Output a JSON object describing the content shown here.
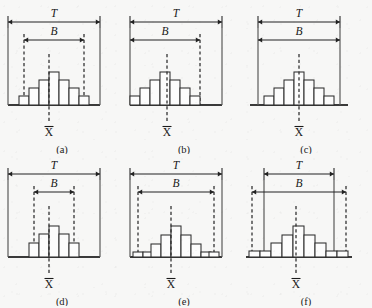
{
  "figure": {
    "background_color": "#f7f7f6",
    "ink_color": "#222222",
    "bar_fill_color": "#fcfcfc",
    "labels": {
      "tolerance": "T",
      "spread": "B",
      "mean": "X"
    },
    "panels": [
      {
        "id": "a",
        "caption": "(a)",
        "tolerance_label": "T",
        "spread_label": "B",
        "mean_label": "X",
        "frame": "box",
        "t_left": 8,
        "t_right": 100,
        "b_left": 24,
        "b_right": 84,
        "b_markers": "dashed-both",
        "mean_x": 54,
        "bars": [
          {
            "x": 24,
            "w": 10,
            "h": 9
          },
          {
            "x": 34,
            "w": 10,
            "h": 17
          },
          {
            "x": 44,
            "w": 10,
            "h": 25
          },
          {
            "x": 54,
            "w": 10,
            "h": 33
          },
          {
            "x": 64,
            "w": 10,
            "h": 25
          },
          {
            "x": 74,
            "w": 10,
            "h": 17
          },
          {
            "x": 84,
            "w": 10,
            "h": 9
          }
        ],
        "bars_offset": -5
      },
      {
        "id": "b",
        "caption": "(b)",
        "tolerance_label": "T",
        "spread_label": "B",
        "mean_label": "X",
        "frame": "box",
        "t_left": 8,
        "t_right": 100,
        "b_left": 8,
        "b_right": 78,
        "b_markers": "dashed-right",
        "mean_x": 45,
        "bars": [
          {
            "x": 8,
            "w": 10,
            "h": 9
          },
          {
            "x": 18,
            "w": 10,
            "h": 17
          },
          {
            "x": 28,
            "w": 10,
            "h": 25
          },
          {
            "x": 38,
            "w": 10,
            "h": 33
          },
          {
            "x": 48,
            "w": 10,
            "h": 25
          },
          {
            "x": 58,
            "w": 10,
            "h": 17
          },
          {
            "x": 68,
            "w": 10,
            "h": 9
          }
        ],
        "bars_offset": 0
      },
      {
        "id": "c",
        "caption": "(c)",
        "tolerance_label": "T",
        "spread_label": "B",
        "mean_label": "X",
        "frame": "baseline",
        "t_left": 14,
        "t_right": 96,
        "b_left": 14,
        "b_right": 96,
        "b_markers": "none",
        "mean_x": 55,
        "bars": [
          {
            "x": 20,
            "w": 10,
            "h": 9
          },
          {
            "x": 30,
            "w": 10,
            "h": 17
          },
          {
            "x": 40,
            "w": 10,
            "h": 25
          },
          {
            "x": 50,
            "w": 10,
            "h": 33
          },
          {
            "x": 60,
            "w": 10,
            "h": 25
          },
          {
            "x": 70,
            "w": 10,
            "h": 17
          },
          {
            "x": 80,
            "w": 10,
            "h": 9
          }
        ],
        "bars_offset": 0
      },
      {
        "id": "d",
        "caption": "(d)",
        "tolerance_label": "T",
        "spread_label": "B",
        "mean_label": "X",
        "frame": "box",
        "t_left": 8,
        "t_right": 100,
        "b_left": 34,
        "b_right": 74,
        "b_markers": "dashed-both",
        "mean_x": 54,
        "bars": [
          {
            "x": 34,
            "w": 10,
            "h": 14
          },
          {
            "x": 44,
            "w": 10,
            "h": 23
          },
          {
            "x": 54,
            "w": 10,
            "h": 31
          },
          {
            "x": 64,
            "w": 10,
            "h": 23
          },
          {
            "x": 74,
            "w": 10,
            "h": 14
          }
        ],
        "bars_offset": -5
      },
      {
        "id": "e",
        "caption": "(e)",
        "tolerance_label": "T",
        "spread_label": "B",
        "mean_label": "X",
        "frame": "box",
        "t_left": 8,
        "t_right": 100,
        "b_left": 16,
        "b_right": 92,
        "b_markers": "dashed-both",
        "mean_x": 54,
        "bars": [
          {
            "x": 16,
            "w": 10,
            "h": 5
          },
          {
            "x": 26,
            "w": 10,
            "h": 5
          },
          {
            "x": 34,
            "w": 10,
            "h": 13
          },
          {
            "x": 44,
            "w": 10,
            "h": 22
          },
          {
            "x": 54,
            "w": 10,
            "h": 31
          },
          {
            "x": 64,
            "w": 10,
            "h": 22
          },
          {
            "x": 74,
            "w": 10,
            "h": 13
          },
          {
            "x": 84,
            "w": 10,
            "h": 5
          },
          {
            "x": 92,
            "w": 10,
            "h": 5
          }
        ],
        "bars_offset": -5
      },
      {
        "id": "f",
        "caption": "(f)",
        "tolerance_label": "T",
        "spread_label": "B",
        "mean_label": "X",
        "frame": "box-narrow",
        "t_left": 20,
        "t_right": 90,
        "b_left": 8,
        "b_right": 102,
        "b_markers": "dashed-both",
        "mean_x": 55,
        "bars": [
          {
            "x": 8,
            "w": 11,
            "h": 6
          },
          {
            "x": 19,
            "w": 11,
            "h": 6
          },
          {
            "x": 30,
            "w": 11,
            "h": 14
          },
          {
            "x": 41,
            "w": 11,
            "h": 22
          },
          {
            "x": 52,
            "w": 11,
            "h": 31
          },
          {
            "x": 63,
            "w": 11,
            "h": 22
          },
          {
            "x": 74,
            "w": 11,
            "h": 14
          },
          {
            "x": 85,
            "w": 11,
            "h": 6
          },
          {
            "x": 96,
            "w": 11,
            "h": 6
          }
        ],
        "bars_offset": -3
      }
    ]
  }
}
